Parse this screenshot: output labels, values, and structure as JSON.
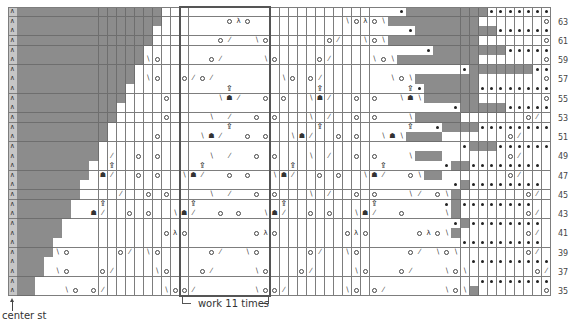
{
  "chart_data": {
    "type": "table",
    "columns": 60,
    "rows_count": 30,
    "row_labels_right": [
      "63",
      "61",
      "59",
      "57",
      "55",
      "53",
      "51",
      "49",
      "47",
      "45",
      "43",
      "41",
      "39",
      "37",
      "35"
    ],
    "first_row": 64,
    "last_row": 35,
    "legend_symbols": {
      "A": "center stitch (s2kp / ∧)",
      "#": "no stitch (gray)",
      ".": "knit",
      "o": "yarn over",
      "/": "k2tog",
      "\\": "ssk",
      "^": "sk2p",
      "*": "purl",
      "T": "cluster top",
      "B": "cluster bottom"
    },
    "grid": [
      "A################..........................*#########********",
      "A################.......o^o..........\\o^o\\##########.......o/",
      "A###############............................*#########********",
      "A###############.......o/..\\o......o/..\\o\\##########.......o/",
      "A##############...............................*########********",
      "A##############\\o.....o/....\\o....o/....\\o\\#########.......o/",
      "A#############....................................*#######********",
      "A#############.\\o..o/o/.......\\o.o/.......\\o\\#######.......o/",
      "A############...........T.........T.........T*######********",
      "A############....o.....\\B/..o.o..\\B/..o.o..\\B\\######.......o/",
      "A###########.....................................*#####********",
      "A###########.....o....\\./..o.o...\\./..o.o...\\#####.......o/",
      "A##########.............T.........T.........T..*####********",
      "A##########.....o....\\B/..o.o..\\B/..o.o..\\B\\####.......o/",
      "A#########........................................*###********",
      "A#########./..o.o.....\\./..o.o...\\./..o.o...\\###.......o/",
      "A########..T.........T.........T.........T......*##********",
      "A########.B/..o.o..\\B/..o.o..\\B/..o.o..\\B/..o\\##.......o/",
      "A#######.........................................*#********",
      "A#######..../..o.o....\\./..o.o...\\./..o.o...\\/.o\\#.......o/",
      "A######...T.........T.........T.........T.......*#********",
      "A######..B/..o.o..\\B/..o.o..\\B/..o.o..\\B/..o....\\#.......o/",
      "A#####...........................................*#********",
      "A#####...........o^o.......o^o.......o^o.....o^o\\#.......o/",
      "A####.............................................*********",
      "A####\\o.....o/.\\o.....o/..\\o.....o/..\\o.....o/.\\o\\.......o/",
      "A###...............................................*********",
      "A###.\\o...o/....\\o...o/....\\o...o/....\\o...o/...\\o\\.......o/",
      "A##.................................................*********",
      "A##...\\o.o/......\\oo/......\\oo/......\\o.o/......\\o\\#.......o/"
    ],
    "repeat_box": {
      "start_col": 19,
      "end_col": 28,
      "label": "work 11 times"
    },
    "center_label": "center st"
  }
}
